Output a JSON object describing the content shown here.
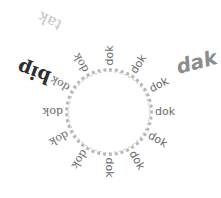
{
  "ring": {
    "cx": 109,
    "cy": 112,
    "r": 44,
    "color": "#b8b8b8"
  },
  "radial_words": [
    {
      "text": "dok",
      "angle": -90,
      "serif": false
    },
    {
      "text": "dok",
      "angle": -58,
      "serif": false
    },
    {
      "text": "dok",
      "angle": -28,
      "serif": false
    },
    {
      "text": "dok",
      "angle": 0,
      "serif": false
    },
    {
      "text": "dok",
      "angle": 30,
      "serif": false
    },
    {
      "text": "dok",
      "angle": 60,
      "serif": false
    },
    {
      "text": "dok",
      "angle": 90,
      "serif": false
    },
    {
      "text": "dok",
      "angle": 122,
      "serif": true
    },
    {
      "text": "dok",
      "angle": 152,
      "serif": true
    },
    {
      "text": "dok",
      "angle": 180,
      "serif": true
    },
    {
      "text": "dok",
      "angle": 210,
      "serif": true
    },
    {
      "text": "dok",
      "angle": 240,
      "serif": true
    }
  ],
  "big_words": [
    {
      "text": "dak",
      "x": 196,
      "y": 62,
      "rotate": -15,
      "size": 20,
      "color": "#8c8c8c",
      "weight": "bold",
      "italic": true,
      "serif": false
    },
    {
      "text": "bip",
      "x": 34,
      "y": 72,
      "rotate": 200,
      "size": 19,
      "color": "#2e2e2e",
      "weight": "bold",
      "italic": false,
      "serif": true
    },
    {
      "text": "tak",
      "x": 50,
      "y": 20,
      "rotate": 205,
      "size": 15,
      "color": "#c4c4c4",
      "weight": "normal",
      "italic": false,
      "serif": true
    }
  ]
}
